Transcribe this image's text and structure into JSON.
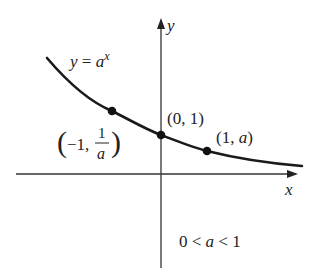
{
  "diagram": {
    "function_label": {
      "lhs": "y",
      "eq": " = ",
      "base": "a",
      "exp": "x"
    },
    "axes": {
      "x_label": "x",
      "y_label": "y"
    },
    "points": [
      {
        "id": "neg-one",
        "coords_text_open": "(",
        "coords_text_a": "−1, ",
        "frac_num": "1",
        "frac_den": "a",
        "coords_text_close": ")"
      },
      {
        "id": "zero",
        "text": "(0, 1)"
      },
      {
        "id": "one",
        "text_open": "(1, ",
        "text_var": "a",
        "text_close": ")"
      }
    ],
    "condition": {
      "left": "0 < ",
      "var": "a",
      "right": " < 1"
    },
    "colors": {
      "ink": "#1a1a1a",
      "background": "#ffffff"
    }
  }
}
